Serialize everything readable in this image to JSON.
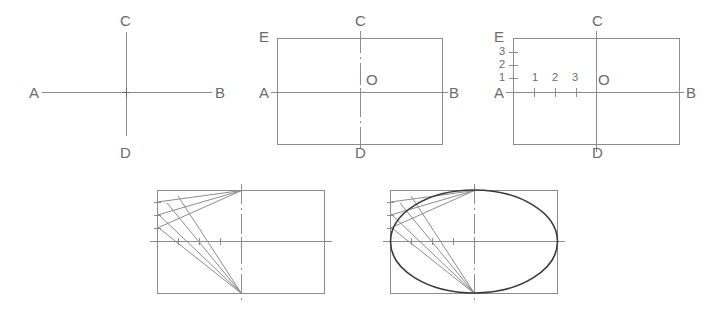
{
  "figure": {
    "type": "technical-drawing",
    "background_color": "#ffffff",
    "line_color": "#8c8c8c",
    "label_color": "#6b6b6b",
    "heavy_line_color": "#3a3a3a",
    "width": 717,
    "height": 314
  },
  "steps": [
    {
      "id": "step1",
      "name": "axes",
      "description": "Draw major axis AB and minor axis CD crossing at centre",
      "labels": [
        {
          "text": "A",
          "x": 29,
          "y": 85
        },
        {
          "text": "B",
          "x": 215,
          "y": 85
        },
        {
          "text": "C",
          "x": 120,
          "y": 13
        },
        {
          "text": "D",
          "x": 120,
          "y": 145
        }
      ]
    },
    {
      "id": "step2",
      "name": "enclosing-rectangle",
      "description": "Construct the rectangle about the axes, centre O, corner E",
      "labels": [
        {
          "text": "A",
          "x": 259,
          "y": 85
        },
        {
          "text": "B",
          "x": 449,
          "y": 85
        },
        {
          "text": "C",
          "x": 355,
          "y": 13
        },
        {
          "text": "D",
          "x": 355,
          "y": 145
        },
        {
          "text": "E",
          "x": 259,
          "y": 29
        },
        {
          "text": "O",
          "x": 366,
          "y": 72
        }
      ]
    },
    {
      "id": "step3",
      "name": "divided-sides",
      "description": "Divide AE and AO into the same number of equal parts, numbered 1 2 3",
      "labels": [
        {
          "text": "A",
          "x": 494,
          "y": 85
        },
        {
          "text": "B",
          "x": 686,
          "y": 85
        },
        {
          "text": "C",
          "x": 592,
          "y": 13
        },
        {
          "text": "D",
          "x": 592,
          "y": 145
        },
        {
          "text": "E",
          "x": 494,
          "y": 29
        },
        {
          "text": "O",
          "x": 598,
          "y": 72
        }
      ],
      "vertical_divisions": [
        {
          "text": "1",
          "x": 499,
          "y": 73
        },
        {
          "text": "2",
          "x": 499,
          "y": 59
        },
        {
          "text": "3",
          "x": 499,
          "y": 46
        }
      ],
      "horizontal_divisions": [
        {
          "text": "1",
          "x": 531,
          "y": 72
        },
        {
          "text": "2",
          "x": 551,
          "y": 72
        },
        {
          "text": "3",
          "x": 571,
          "y": 72
        }
      ]
    },
    {
      "id": "step4",
      "name": "construction-rays",
      "description": "Join C to each division on AE and D to each division on AO; rays intersect"
    },
    {
      "id": "step5",
      "name": "completed-ellipse",
      "description": "Trace a smooth curve through the ray intersections to complete the ellipse"
    }
  ]
}
